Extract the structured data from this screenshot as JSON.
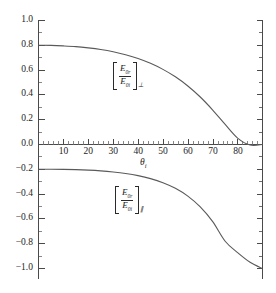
{
  "figure": {
    "title": "",
    "background_color": "#ffffff",
    "axis_color": "#4a4a4a",
    "curve_color": "#5a5a5a"
  },
  "axes": {
    "x": {
      "label_main": "θ",
      "label_sub": "i",
      "ticks": [
        10,
        20,
        30,
        40,
        50,
        60,
        70,
        80
      ],
      "tick_labels": [
        "10",
        "20",
        "30",
        "40",
        "50",
        "60",
        "70",
        "80"
      ],
      "range": [
        0,
        90
      ],
      "minor_tick_step": 2
    },
    "y": {
      "ticks": [
        1.0,
        0.8,
        0.6,
        0.4,
        0.2,
        0.0,
        -0.2,
        -0.4,
        -0.6,
        -0.8,
        -1.0
      ],
      "tick_labels": [
        "1.0",
        "0.8",
        "0.6",
        "0.4",
        "0.2",
        "0.0",
        "−0.2",
        "−0.4",
        "−0.6",
        "−0.8",
        "−1.0"
      ],
      "range": [
        -1.0,
        1.0
      ],
      "minor_tick_step": 0.05
    }
  },
  "annotations": {
    "upper": {
      "numerator_main": "E",
      "numerator_sub": "0r",
      "denominator_main": "E",
      "denominator_sub": "0i",
      "outer_sub": "⊥"
    },
    "lower": {
      "numerator_main": "E",
      "numerator_sub": "0r",
      "denominator_main": "E",
      "denominator_sub": "0i",
      "outer_sub": "∥"
    }
  },
  "chart_data": {
    "type": "line",
    "title": "",
    "xlabel": "θi",
    "ylabel": "",
    "xlim": [
      0,
      90
    ],
    "ylim": [
      -1.0,
      1.0
    ],
    "grid": false,
    "legend": "none (curves labelled in-plot)",
    "x": [
      0,
      5,
      10,
      15,
      20,
      25,
      30,
      35,
      40,
      45,
      50,
      55,
      60,
      65,
      70,
      75,
      80,
      85,
      90
    ],
    "series": [
      {
        "name": "[E0r/E0i] perpendicular",
        "annotation": "upper",
        "values": [
          0.8,
          0.799,
          0.795,
          0.789,
          0.779,
          0.766,
          0.748,
          0.724,
          0.694,
          0.655,
          0.606,
          0.546,
          0.472,
          0.383,
          0.278,
          0.162,
          0.052,
          -0.004,
          0.0
        ]
      },
      {
        "name": "[E0r/E0i] parallel",
        "annotation": "lower",
        "values": [
          -0.2,
          -0.2,
          -0.201,
          -0.203,
          -0.207,
          -0.213,
          -0.222,
          -0.234,
          -0.251,
          -0.275,
          -0.308,
          -0.353,
          -0.416,
          -0.503,
          -0.622,
          -0.78,
          -0.872,
          -0.95,
          -1.0
        ]
      }
    ]
  }
}
